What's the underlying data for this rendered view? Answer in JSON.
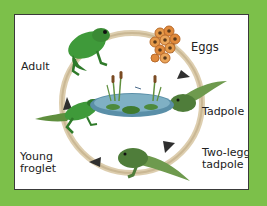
{
  "diagram": {
    "stages": [
      {
        "id": "eggs",
        "label": "Eggs"
      },
      {
        "id": "tadpole",
        "label": "Tadpole"
      },
      {
        "id": "two-legged-tadpole",
        "label_line1": "Two-legged",
        "label_line2": "tadpole"
      },
      {
        "id": "young-froglet",
        "label_line1": "Young",
        "label_line2": "froglet"
      },
      {
        "id": "adult",
        "label": "Adult"
      }
    ],
    "center": "pond-with-cattails",
    "colors": {
      "background": "#7cc04a",
      "frame_border": "#3a3a3a",
      "cycle_arrow": "#c9b38a",
      "arrow_head": "#2f2f2f",
      "frog_green": "#3f9a3a",
      "egg_orange": "#e08a3c",
      "pond": "#5a8fa8"
    }
  }
}
